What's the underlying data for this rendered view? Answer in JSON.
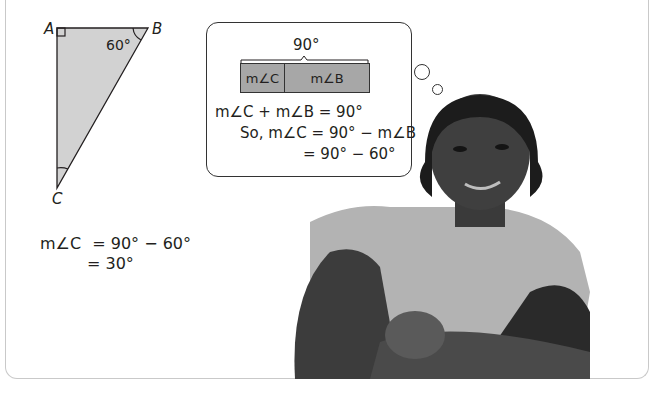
{
  "triangle": {
    "vertices": {
      "a": "A",
      "b": "B",
      "c": "C"
    },
    "angle_b_label": "60°",
    "fill_color": "#d2d2d2",
    "right_angle_at": "A"
  },
  "thought_bubble": {
    "total_label": "90°",
    "bar_segments": [
      {
        "label": "m∠C",
        "color": "#a7a7a7"
      },
      {
        "label": "m∠B",
        "color": "#a7a7a7"
      }
    ],
    "equations": [
      {
        "lhs": "m∠C + m∠B",
        "rhs": "= 90°"
      },
      {
        "lhs": "So, m∠C",
        "rhs": "= 90° − m∠B"
      },
      {
        "lhs": "",
        "rhs": "= 90° − 60°"
      }
    ]
  },
  "solution": {
    "lines": [
      {
        "lhs": "m∠C",
        "rhs": "= 90° − 60°"
      },
      {
        "lhs": "",
        "rhs": "= 30°"
      }
    ]
  },
  "photo": {
    "subject": "smiling girl leaning on crossed arms"
  }
}
